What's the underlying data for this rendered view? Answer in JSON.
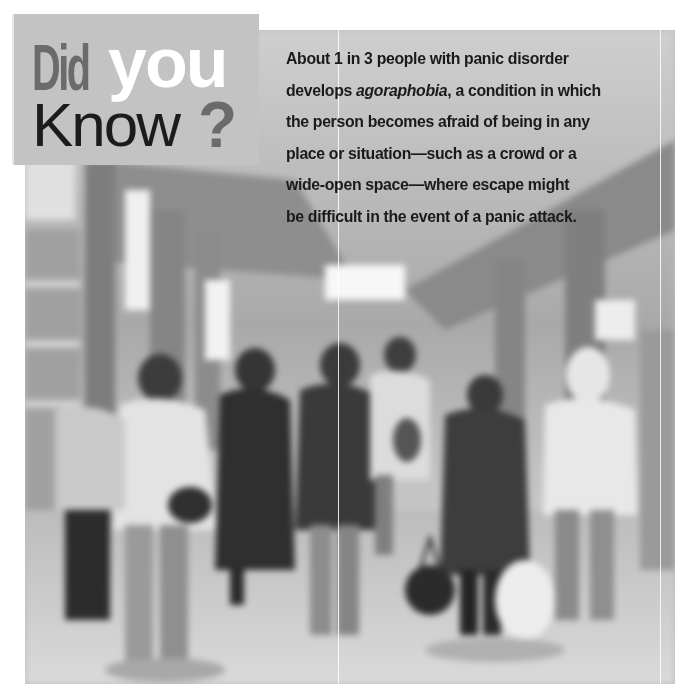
{
  "callout": {
    "title_part1": "Did",
    "title_part2": "you",
    "title_part3": "Know",
    "title_punct": "?"
  },
  "fact": {
    "lines": [
      {
        "pre": "About 1 in 3 people with panic disorder",
        "em": "",
        "post": ""
      },
      {
        "pre": "develops ",
        "em": "agoraphobia",
        "post": ", a condition in which"
      },
      {
        "pre": "the person becomes afraid of being in any",
        "em": "",
        "post": ""
      },
      {
        "pre": "place or situation—such as a crowd or a",
        "em": "",
        "post": ""
      },
      {
        "pre": "wide-open space—where escape might",
        "em": "",
        "post": ""
      },
      {
        "pre": "be difficult in the event of a panic attack.",
        "em": "",
        "post": ""
      }
    ]
  },
  "photo": {
    "subject": "blurred crowd of people walking through a station concourse",
    "style": "grayscale"
  },
  "colors": {
    "title_box": "#c3c3c3",
    "title_dark": "#6b6b6b",
    "title_light": "#ffffff",
    "text": "#1a1a1a"
  }
}
